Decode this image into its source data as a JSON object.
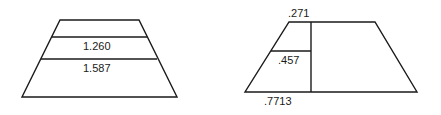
{
  "figures": [
    {
      "name": "left-trapezoid",
      "labels": [
        "1.260",
        "1.587"
      ]
    },
    {
      "name": "right-trapezoid",
      "labels": {
        "top": ".271",
        "middle": ".457",
        "bottom": ".7713"
      }
    }
  ],
  "colors": {
    "stroke": "#1a1a1a",
    "background": "#ffffff"
  }
}
